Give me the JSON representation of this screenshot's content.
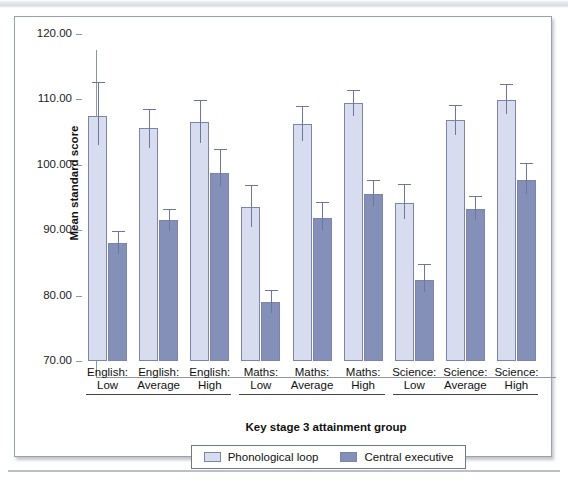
{
  "chart_data": {
    "type": "bar",
    "title": "",
    "xlabel": "Key stage 3 attainment group",
    "ylabel": "Mean standard score",
    "ylim": [
      70,
      120
    ],
    "yticks": [
      120.0,
      110.0,
      100.0,
      90.0,
      80.0,
      70.0
    ],
    "ytick_labels": [
      "120.00",
      "110.00",
      "100.00",
      "90.00",
      "80.00",
      "70.00"
    ],
    "grid": false,
    "legend_position": "bottom",
    "error_bars": "95% CI",
    "categories": [
      "English: Low",
      "English: Average",
      "English: High",
      "Maths: Low",
      "Maths: Average",
      "Maths: High",
      "Science: Low",
      "Science: Average",
      "Science: High"
    ],
    "category_lines": [
      [
        "English:",
        "Low"
      ],
      [
        "English:",
        "Average"
      ],
      [
        "English:",
        "High"
      ],
      [
        "Maths:",
        "Low"
      ],
      [
        "Maths:",
        "Average"
      ],
      [
        "Maths:",
        "High"
      ],
      [
        "Science:",
        "Low"
      ],
      [
        "Science:",
        "Average"
      ],
      [
        "Science:",
        "High"
      ]
    ],
    "group_spans": [
      {
        "label": "English",
        "start": 0,
        "end": 2
      },
      {
        "label": "Maths",
        "start": 3,
        "end": 5
      },
      {
        "label": "Science",
        "start": 6,
        "end": 8
      }
    ],
    "series": [
      {
        "name": "Phonological loop",
        "color": "#d7dcef",
        "values": [
          107.4,
          105.6,
          106.5,
          93.6,
          106.3,
          109.4,
          94.2,
          106.9,
          109.9
        ],
        "err_low": [
          103.1,
          102.6,
          103.3,
          90.5,
          103.7,
          107.5,
          91.7,
          104.6,
          107.7
        ],
        "err_high": [
          112.6,
          108.6,
          109.9,
          96.9,
          109.0,
          111.5,
          97.1,
          109.2,
          112.4
        ]
      },
      {
        "name": "Central executive",
        "color": "#8490b8",
        "values": [
          88.1,
          91.5,
          98.8,
          79.0,
          91.9,
          95.5,
          82.4,
          93.3,
          97.7
        ],
        "err_low": [
          86.3,
          89.8,
          96.8,
          77.4,
          90.1,
          93.7,
          80.5,
          91.5,
          95.5
        ],
        "err_high": [
          89.9,
          93.3,
          102.4,
          80.9,
          94.3,
          97.6,
          84.9,
          95.3,
          100.2
        ]
      }
    ]
  },
  "axis": {
    "y_title": "Mean standard score",
    "x_title": "Key stage 3 attainment group"
  },
  "legend": {
    "items": [
      {
        "label": "Phonological loop",
        "swatch": "light"
      },
      {
        "label": "Central executive",
        "swatch": "dark"
      }
    ]
  }
}
